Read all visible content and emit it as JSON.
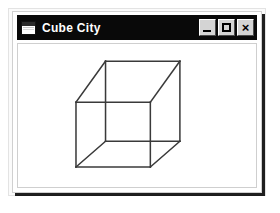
{
  "window": {
    "title": "Cube City",
    "icon": "window-icon",
    "buttons": [
      {
        "name": "minimize",
        "label": "_",
        "glyph": "minimize-icon"
      },
      {
        "name": "maximize",
        "label": "□",
        "glyph": "maximize-icon"
      },
      {
        "name": "close",
        "label": "×",
        "glyph": "close-icon"
      }
    ],
    "colors": {
      "titlebar_background": "#090909",
      "titlebar_text": "#ffffff",
      "client_background": "#ffffff",
      "button_face": "#d4d4d4",
      "wireframe_stroke": "#3a3a3a",
      "window_shadow": "#000000"
    }
  },
  "canvas": {
    "name": "cube-drawing",
    "description": "wireframe cube",
    "stroke_color": "#3a3a3a",
    "stroke_width": 1.6,
    "viewbox": "0 0 240 150",
    "vertices": {
      "front_top_left": [
        56,
        61
      ],
      "front_top_right": [
        134,
        61
      ],
      "front_bottom_right": [
        134,
        129
      ],
      "front_bottom_left": [
        56,
        129
      ],
      "back_top_left": [
        87,
        18
      ],
      "back_top_right": [
        165,
        18
      ],
      "back_bottom_right": [
        165,
        102
      ],
      "back_bottom_left": [
        87,
        102
      ]
    },
    "edges": [
      [
        "front_top_left",
        "front_top_right"
      ],
      [
        "front_top_right",
        "front_bottom_right"
      ],
      [
        "front_bottom_right",
        "front_bottom_left"
      ],
      [
        "front_bottom_left",
        "front_top_left"
      ],
      [
        "back_top_left",
        "back_top_right"
      ],
      [
        "back_top_right",
        "back_bottom_right"
      ],
      [
        "back_bottom_right",
        "back_bottom_left"
      ],
      [
        "back_bottom_left",
        "back_top_left"
      ],
      [
        "front_top_left",
        "back_top_left"
      ],
      [
        "front_top_right",
        "back_top_right"
      ],
      [
        "front_bottom_right",
        "back_bottom_right"
      ],
      [
        "front_bottom_left",
        "back_bottom_left"
      ]
    ]
  }
}
